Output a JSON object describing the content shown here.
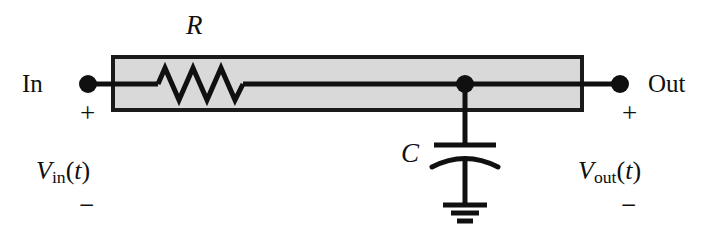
{
  "figure": {
    "kind": "rc-low-pass-filter-circuit",
    "background_color": "#ffffff",
    "ink_color": "#101010",
    "box_fill_color": "#d9d9d9",
    "box_border_color": "#1a1a1a"
  },
  "labels": {
    "resistor": "R",
    "capacitor": "C",
    "input_terminal": "In",
    "output_terminal": "Out",
    "input_voltage": {
      "symbol": "V",
      "subscript": "in",
      "argument": "t",
      "full": "Vin(t)"
    },
    "output_voltage": {
      "symbol": "V",
      "subscript": "out",
      "argument": "t",
      "full": "Vout(t)"
    },
    "input_plus": "+",
    "input_minus": "−",
    "output_plus": "+",
    "output_minus": "−"
  },
  "components": {
    "resistor": {
      "name": "R",
      "symbol": "zigzag",
      "peaks": 3,
      "orientation": "horizontal"
    },
    "capacitor": {
      "name": "C",
      "symbol": "curved-plate",
      "plates": 2,
      "orientation": "vertical"
    },
    "ground": {
      "symbol": "earth-ground",
      "bars": 3
    },
    "nodes": [
      {
        "name": "input-node",
        "label": "In"
      },
      {
        "name": "output-node",
        "label": "Out"
      },
      {
        "name": "capacitor-junction-node",
        "label": ""
      }
    ]
  },
  "geometry": {
    "box": {
      "x": 113,
      "y": 57,
      "width": 469,
      "height": 53
    },
    "wire_y": 84,
    "in_dot_x": 88,
    "out_dot_x": 620,
    "junction_x": 465,
    "resistor_span": [
      158,
      243
    ],
    "dot_radius": 9
  }
}
